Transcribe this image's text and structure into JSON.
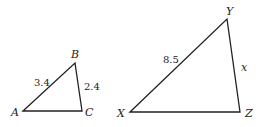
{
  "triangles": [
    {
      "name": "ABC",
      "vertices": {
        "A": "A",
        "B": "B",
        "C": "C"
      },
      "sides": {
        "AB": "3.4",
        "BC": "2.4"
      }
    },
    {
      "name": "XYZ",
      "vertices": {
        "X": "X",
        "Y": "Y",
        "Z": "Z"
      },
      "sides": {
        "XY": "8.5",
        "YZ": "x"
      }
    }
  ],
  "colors": {
    "stroke": "#222222",
    "background": "#ffffff"
  }
}
